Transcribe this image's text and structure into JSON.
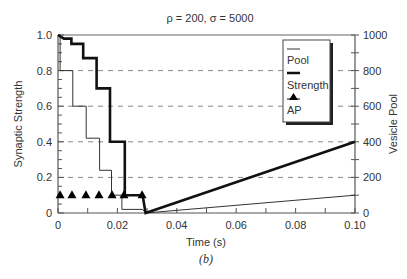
{
  "chart_data": {
    "type": "line",
    "title": "ρ = 200, σ = 5000",
    "caption": "(b)",
    "xlabel": "Time (s)",
    "ylabel": "Synaptic Strength",
    "y2label": "Vesicle Pool",
    "xlim": [
      0,
      0.1
    ],
    "ylim": [
      0,
      1.0
    ],
    "y2lim": [
      0,
      1000
    ],
    "x_ticks": [
      0,
      0.02,
      0.04,
      0.06,
      0.08,
      0.1
    ],
    "x_tick_labels": [
      "0",
      "0.02",
      "0.04",
      "0.06",
      "0.08",
      "0.10"
    ],
    "y_ticks": [
      0,
      0.2,
      0.4,
      0.6,
      0.8,
      1.0
    ],
    "y_tick_labels": [
      "0",
      "0.2",
      "0.4",
      "0.6",
      "0.8",
      "1.0"
    ],
    "y2_ticks": [
      0,
      200,
      400,
      600,
      800,
      1000
    ],
    "y2_tick_labels": [
      "0",
      "200",
      "400",
      "600",
      "800",
      "1000"
    ],
    "grid": "horizontal dashed",
    "legend_position": "upper right",
    "series": [
      {
        "name": "Pool",
        "style": "thin",
        "axis": "left-normalized",
        "x": [
          0,
          0.0007,
          0.0007,
          0.005,
          0.005,
          0.0095,
          0.0095,
          0.014,
          0.014,
          0.018,
          0.018,
          0.0215,
          0.0215,
          0.0285,
          0.0295,
          0.1
        ],
        "y": [
          1.0,
          1.0,
          0.8,
          0.8,
          0.6,
          0.6,
          0.42,
          0.42,
          0.24,
          0.24,
          0.1,
          0.1,
          0.02,
          0.02,
          0.0,
          0.1
        ]
      },
      {
        "name": "Strength",
        "style": "thick",
        "axis": "left",
        "x": [
          0,
          0.002,
          0.002,
          0.0045,
          0.0045,
          0.0085,
          0.0085,
          0.013,
          0.013,
          0.0175,
          0.0175,
          0.0205,
          0.0205,
          0.0225,
          0.0225,
          0.0285,
          0.0295,
          0.1
        ],
        "y": [
          1.0,
          0.98,
          0.98,
          0.98,
          0.95,
          0.95,
          0.87,
          0.87,
          0.7,
          0.7,
          0.4,
          0.4,
          0.4,
          0.4,
          0.1,
          0.1,
          0.0,
          0.4
        ]
      },
      {
        "name": "AP",
        "style": "triangle-markers",
        "axis": "left",
        "x": [
          0.0007,
          0.0047,
          0.0094,
          0.0138,
          0.0182,
          0.0222,
          0.0283
        ],
        "y": [
          0.1,
          0.1,
          0.1,
          0.1,
          0.1,
          0.1,
          0.1
        ]
      }
    ],
    "legend": [
      {
        "label": "Pool",
        "marker": "thin-line"
      },
      {
        "label": "Strength",
        "marker": "thick-line"
      },
      {
        "label": "AP",
        "marker": "triangle"
      }
    ]
  },
  "colors": {
    "axis": "#555555",
    "grid": "#888888",
    "pool": "#333333",
    "strength": "#111111",
    "ap": "#000000",
    "top_border": "#999999"
  }
}
